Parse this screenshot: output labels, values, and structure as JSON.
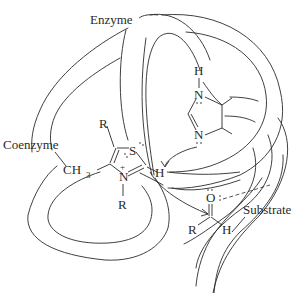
{
  "figure": {
    "type": "schematic mechanism diagram"
  },
  "labels": {
    "enzyme": "Enzyme",
    "coenzyme": "Coenzyme",
    "substrate": "Substrate"
  },
  "coenzyme": {
    "ring": "thiazolium",
    "substituent_top": "R",
    "sulfur": "S",
    "nitrogen": "N",
    "nitrogen_charge": "+",
    "nitrogen_substituent": "R",
    "methyl": "CH",
    "methyl_subscript": "3",
    "acidic_hydrogen": "H"
  },
  "enzyme_base": {
    "ring": "imidazole",
    "hydrogen": "H",
    "n1": "N",
    "n3": "N"
  },
  "substrate": {
    "oxygen": "O",
    "r_group": "R",
    "hydrogen": "H"
  },
  "colors": {
    "line": "#2a2a2a",
    "background": "#ffffff"
  }
}
